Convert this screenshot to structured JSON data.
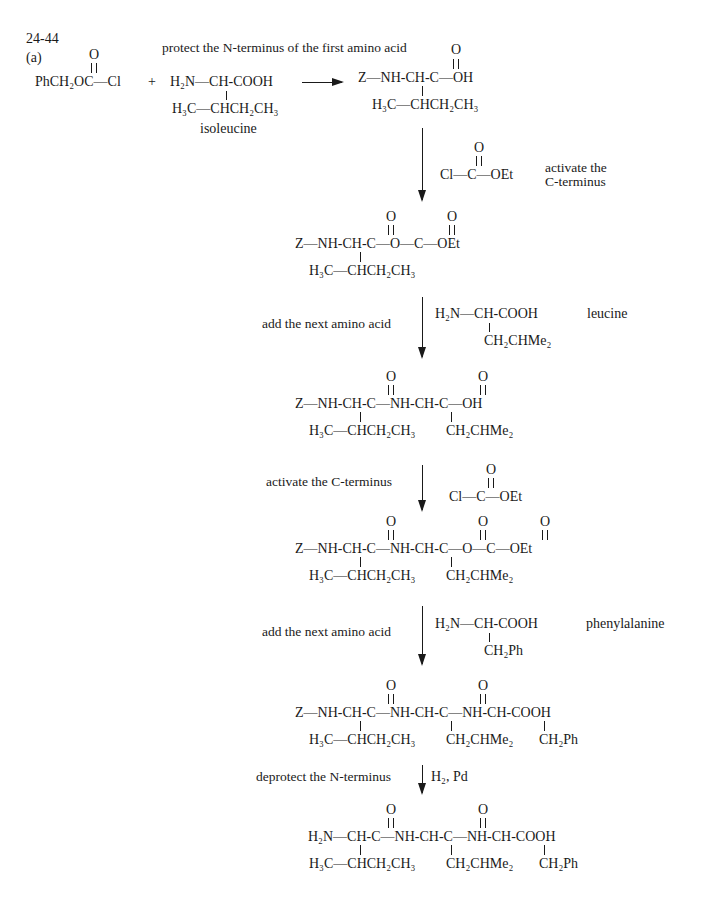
{
  "problem": {
    "number": "24-44",
    "part": "(a)"
  },
  "step1": {
    "label": "protect the N-terminus of the first amino acid",
    "reagent": {
      "carbonyl_o": "O",
      "formula": "PhCH₂OC—Cl"
    },
    "plus": "+",
    "amino_acid": {
      "top": "H₂N—CH-COOH",
      "side": "H₃C—CHCH₂CH₃",
      "name": "isoleucine"
    },
    "product": {
      "carbonyl_o": "O",
      "top": "Z—NH-CH-C—OH",
      "side": "H₃C—CHCH₂CH₃"
    }
  },
  "step2": {
    "reagent": {
      "carbonyl_o": "O",
      "formula": "Cl—C—OEt"
    },
    "label_line1": "activate the",
    "label_line2": "C-terminus",
    "product": {
      "o1": "O",
      "o2": "O",
      "top": "Z—NH-CH-C—O—C—OEt",
      "side": "H₃C—CHCH₂CH₃"
    }
  },
  "step3": {
    "label": "add the next amino acid",
    "amino_acid": {
      "top": "H₂N—CH-COOH",
      "side": "CH₂CHMe₂",
      "name": "leucine"
    },
    "product": {
      "o1": "O",
      "o2": "O",
      "top": "Z—NH-CH-C—NH-CH-C—OH",
      "side1": "H₃C—CHCH₂CH₃",
      "side2": "CH₂CHMe₂"
    }
  },
  "step4": {
    "label": "activate the C-terminus",
    "reagent": {
      "carbonyl_o": "O",
      "formula": "Cl—C—OEt"
    },
    "product": {
      "o1": "O",
      "o2": "O",
      "o3": "O",
      "top": "Z—NH-CH-C—NH-CH-C—O—C—OEt",
      "side1": "H₃C—CHCH₂CH₃",
      "side2": "CH₂CHMe₂"
    }
  },
  "step5": {
    "label": "add the next amino acid",
    "amino_acid": {
      "top": "H₂N—CH-COOH",
      "side": "CH₂Ph",
      "name": "phenylalanine"
    },
    "product": {
      "o1": "O",
      "o2": "O",
      "top": "Z—NH-CH-C—NH-CH-C—NH-CH-COOH",
      "side1": "H₃C—CHCH₂CH₃",
      "side2": "CH₂CHMe₂",
      "side3": "CH₂Ph"
    }
  },
  "step6": {
    "label": "deprotect the N-terminus",
    "reagent": "H₂, Pd",
    "product": {
      "o1": "O",
      "o2": "O",
      "top": "H₂N—CH-C—NH-CH-C—NH-CH-COOH",
      "side1": "H₃C—CHCH₂CH₃",
      "side2": "CH₂CHMe₂",
      "side3": "CH₂Ph"
    }
  }
}
